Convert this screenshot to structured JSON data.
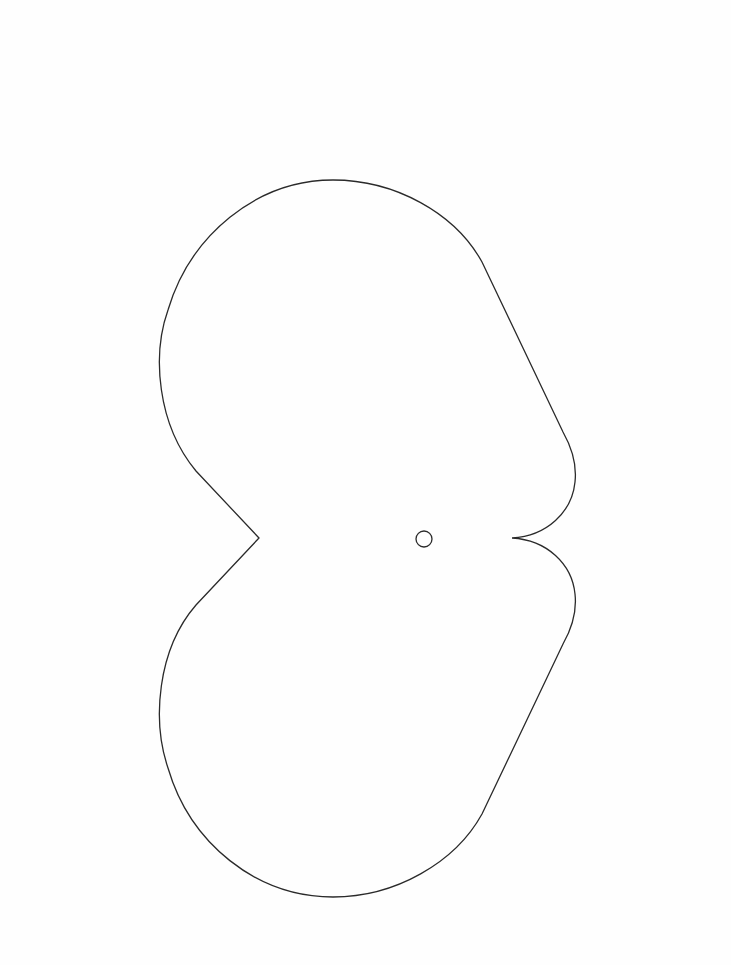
{
  "page": {
    "background": "#fefefe",
    "width": 731,
    "height": 965
  },
  "figure": {
    "stroke_color": "#2a2a2a",
    "stroke_width": 1.3,
    "fill": "none",
    "outline": {
      "shape": "sideways-heart",
      "left_notch": [
        259,
        538
      ],
      "right_cusp": [
        512,
        538
      ],
      "bounds": {
        "x_min": 160,
        "x_max": 576,
        "y_min": 180,
        "y_max": 897
      }
    },
    "center_hole": {
      "shape": "circle",
      "cx": 424,
      "cy": 539,
      "r": 8
    }
  }
}
